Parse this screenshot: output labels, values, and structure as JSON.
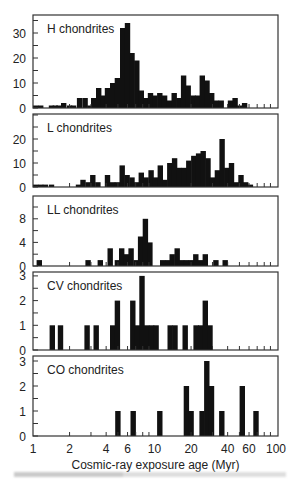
{
  "figure": {
    "xlabel": "Cosmic-ray exposure age (Myr)",
    "x_ticks": [
      {
        "value": 1,
        "label": "1"
      },
      {
        "value": 2,
        "label": "2"
      },
      {
        "value": 4,
        "label": "4"
      },
      {
        "value": 6,
        "label": "6"
      },
      {
        "value": 10,
        "label": "10"
      },
      {
        "value": 20,
        "label": "20"
      },
      {
        "value": 40,
        "label": "40"
      },
      {
        "value": 60,
        "label": "60"
      },
      {
        "value": 100,
        "label": "100"
      }
    ],
    "bar_color": "#111111",
    "axis_color": "#333333"
  },
  "chart_data": [
    {
      "type": "bar",
      "title": "H chondrites",
      "xlabel": "Cosmic-ray exposure age (Myr)",
      "ylabel": "Number",
      "xscale": "log",
      "xlim": [
        1,
        100
      ],
      "ylim": [
        0,
        37
      ],
      "y_ticks": [
        0,
        10,
        20,
        30
      ],
      "bins": [
        [
          1.0,
          1
        ],
        [
          1.1,
          1
        ],
        [
          1.2,
          0
        ],
        [
          1.35,
          1
        ],
        [
          1.45,
          1
        ],
        [
          1.55,
          1
        ],
        [
          1.7,
          2
        ],
        [
          1.9,
          1
        ],
        [
          2.05,
          1
        ],
        [
          2.3,
          4
        ],
        [
          2.55,
          4
        ],
        [
          2.8,
          1
        ],
        [
          3.0,
          4
        ],
        [
          3.3,
          8
        ],
        [
          3.6,
          5
        ],
        [
          3.9,
          8
        ],
        [
          4.3,
          10
        ],
        [
          4.7,
          12
        ],
        [
          5.2,
          32
        ],
        [
          5.7,
          34
        ],
        [
          6.2,
          22
        ],
        [
          6.8,
          19
        ],
        [
          7.4,
          7
        ],
        [
          8.1,
          4
        ],
        [
          8.8,
          6
        ],
        [
          9.6,
          5
        ],
        [
          10.5,
          6
        ],
        [
          11.5,
          5
        ],
        [
          12.6,
          3
        ],
        [
          13.8,
          6
        ],
        [
          15.1,
          4
        ],
        [
          16.5,
          13
        ],
        [
          18.0,
          9
        ],
        [
          19.7,
          5
        ],
        [
          21.5,
          5
        ],
        [
          23.5,
          13
        ],
        [
          25.7,
          11
        ],
        [
          28.1,
          6
        ],
        [
          30.7,
          3
        ],
        [
          33.6,
          3
        ],
        [
          36.7,
          0
        ],
        [
          40.1,
          3
        ],
        [
          43.8,
          4
        ],
        [
          47.9,
          1
        ],
        [
          52.4,
          2
        ],
        [
          57.2,
          0
        ],
        [
          62.5,
          0
        ]
      ]
    },
    {
      "type": "bar",
      "title": "L chondrites",
      "xlabel": "Cosmic-ray exposure age (Myr)",
      "ylabel": "Number",
      "xscale": "log",
      "xlim": [
        1,
        100
      ],
      "ylim": [
        0,
        30
      ],
      "y_ticks": [
        0,
        10,
        20
      ],
      "bins": [
        [
          1.0,
          1
        ],
        [
          1.1,
          1
        ],
        [
          1.2,
          1
        ],
        [
          1.35,
          1
        ],
        [
          1.5,
          0
        ],
        [
          1.65,
          0
        ],
        [
          1.85,
          0
        ],
        [
          2.05,
          0
        ],
        [
          2.25,
          1
        ],
        [
          2.45,
          3
        ],
        [
          2.7,
          2
        ],
        [
          2.95,
          5
        ],
        [
          3.25,
          2
        ],
        [
          3.55,
          0
        ],
        [
          3.9,
          5
        ],
        [
          4.3,
          2
        ],
        [
          4.7,
          2
        ],
        [
          5.15,
          9
        ],
        [
          5.65,
          5
        ],
        [
          6.2,
          4
        ],
        [
          6.8,
          2
        ],
        [
          7.4,
          6
        ],
        [
          8.1,
          4
        ],
        [
          8.9,
          7
        ],
        [
          9.7,
          4
        ],
        [
          10.6,
          9
        ],
        [
          11.6,
          3
        ],
        [
          12.7,
          10
        ],
        [
          13.9,
          12
        ],
        [
          15.2,
          8
        ],
        [
          16.7,
          8
        ],
        [
          18.2,
          11
        ],
        [
          20.0,
          13
        ],
        [
          21.9,
          14
        ],
        [
          23.9,
          15
        ],
        [
          26.2,
          12
        ],
        [
          28.6,
          4
        ],
        [
          31.3,
          7
        ],
        [
          34.2,
          20
        ],
        [
          37.4,
          8
        ],
        [
          40.9,
          10
        ],
        [
          44.7,
          2
        ],
        [
          48.9,
          5
        ],
        [
          53.5,
          2
        ],
        [
          58.5,
          1
        ],
        [
          64.0,
          0
        ],
        [
          70.0,
          0
        ]
      ]
    },
    {
      "type": "bar",
      "title": "LL chondrites",
      "xlabel": "Cosmic-ray exposure age (Myr)",
      "ylabel": "Number",
      "xscale": "log",
      "xlim": [
        1,
        100
      ],
      "ylim": [
        0,
        11
      ],
      "y_ticks": [
        0,
        4,
        8
      ],
      "bins": [
        [
          1.07,
          1
        ],
        [
          2.7,
          1
        ],
        [
          3.0,
          0
        ],
        [
          3.4,
          1
        ],
        [
          4.1,
          3
        ],
        [
          4.7,
          1
        ],
        [
          5.1,
          3
        ],
        [
          5.6,
          2
        ],
        [
          6.1,
          3
        ],
        [
          6.7,
          1
        ],
        [
          7.3,
          5
        ],
        [
          8.0,
          8
        ],
        [
          8.7,
          4
        ],
        [
          11.1,
          1
        ],
        [
          12.2,
          1
        ],
        [
          13.3,
          2
        ],
        [
          14.6,
          3
        ],
        [
          15.9,
          1
        ],
        [
          17.4,
          1
        ],
        [
          19.1,
          1
        ],
        [
          20.8,
          2
        ],
        [
          22.8,
          1
        ],
        [
          24.9,
          2
        ],
        [
          30.4,
          1
        ],
        [
          36.3,
          1
        ]
      ]
    },
    {
      "type": "bar",
      "title": "CV chondrites",
      "xlabel": "Cosmic-ray exposure age (Myr)",
      "ylabel": "Number",
      "xscale": "log",
      "xlim": [
        1,
        100
      ],
      "ylim": [
        0,
        3.2
      ],
      "y_ticks": [
        0,
        1,
        2,
        3
      ],
      "bins": [
        [
          1.37,
          1
        ],
        [
          1.6,
          1
        ],
        [
          2.65,
          1
        ],
        [
          3.15,
          1
        ],
        [
          4.3,
          1
        ],
        [
          4.7,
          2
        ],
        [
          6.3,
          2
        ],
        [
          6.9,
          1
        ],
        [
          7.5,
          3
        ],
        [
          8.2,
          1
        ],
        [
          9.0,
          1
        ],
        [
          9.8,
          1
        ],
        [
          12.8,
          1
        ],
        [
          14.0,
          1
        ],
        [
          17.0,
          1
        ],
        [
          20.9,
          1
        ],
        [
          22.8,
          1
        ],
        [
          24.9,
          2
        ],
        [
          27.2,
          1
        ]
      ]
    },
    {
      "type": "bar",
      "title": "CO chondrites",
      "xlabel": "Cosmic-ray exposure age (Myr)",
      "ylabel": "Number",
      "xscale": "log",
      "xlim": [
        1,
        100
      ],
      "ylim": [
        0,
        3.2
      ],
      "y_ticks": [
        0,
        1,
        2,
        3
      ],
      "bins": [
        [
          4.75,
          1
        ],
        [
          6.35,
          1
        ],
        [
          10.5,
          1
        ],
        [
          17.4,
          2
        ],
        [
          19.0,
          1
        ],
        [
          23.4,
          1
        ],
        [
          25.6,
          3
        ],
        [
          28.0,
          2
        ],
        [
          34.0,
          1
        ],
        [
          50.2,
          2
        ],
        [
          65.0,
          1
        ]
      ]
    }
  ]
}
